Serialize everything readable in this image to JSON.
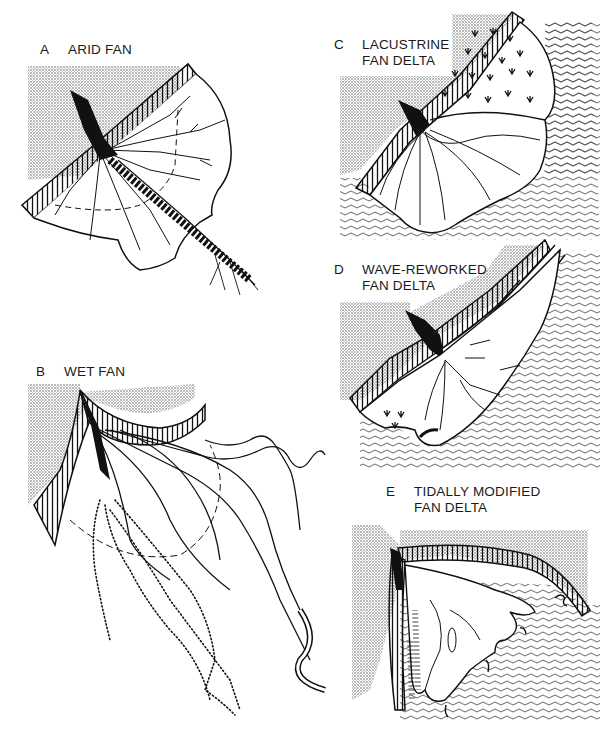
{
  "figure": {
    "panels": [
      {
        "id": "A",
        "letter": "A",
        "title_line1": "ARID FAN",
        "title_line2": ""
      },
      {
        "id": "B",
        "letter": "B",
        "title_line1": "WET FAN",
        "title_line2": ""
      },
      {
        "id": "C",
        "letter": "C",
        "title_line1": "LACUSTRINE",
        "title_line2": "FAN DELTA"
      },
      {
        "id": "D",
        "letter": "D",
        "title_line1": "WAVE-REWORKED",
        "title_line2": "FAN DELTA"
      },
      {
        "id": "E",
        "letter": "E",
        "title_line1": "TIDALLY MODIFIED",
        "title_line2": "FAN DELTA"
      }
    ],
    "colors": {
      "ink": "#111111",
      "stipple": "#bdbdbd",
      "background": "#ffffff",
      "water_lines": "#555555"
    },
    "legend_symbols": {
      "stipple": "upland-bedrock",
      "hachure": "mountain-front-scarp",
      "wavy-lines": "standing-water",
      "marsh-tufts": "vegetated-marsh",
      "dotted-lines": "abandoned-channels"
    }
  }
}
